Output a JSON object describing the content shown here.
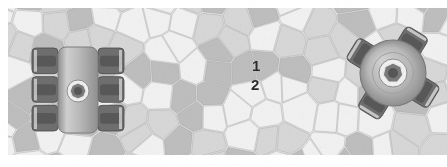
{
  "figure": {
    "kind": "micrograph-schematic",
    "medium": "scanned-grayscale-print",
    "width": 447,
    "height": 167,
    "page_background": "#ffffff",
    "image_bounds": {
      "x": 8,
      "y": 8,
      "width": 439,
      "height": 147
    },
    "description_semantic": "cellular grain / Voronoi microstructure band with two embedded mechanical roller components"
  },
  "palette": {
    "paper": "#ffffff",
    "cell_light": "#f0f0f0",
    "cell_mid": "#d6d6d6",
    "cell_dark": "#bdbdbd",
    "cell_edge": "#9a9a9a",
    "matrix_base": "#e4e4e4",
    "part_body": "#b8b8b8",
    "part_body_light": "#cfcfcf",
    "part_body_dark": "#8f8f8f",
    "roller_dark": "#6e6e6e",
    "roller_darker": "#585858",
    "roller_highlight": "#dcdcdc",
    "hub_ring": "#d8d8d8",
    "hub_socket": "#7a7a7a",
    "hub_core": "#565656",
    "label_text": "#2b2b2b"
  },
  "annotations": {
    "callouts": [
      {
        "id": "callout-1",
        "text": "1",
        "x": 252,
        "y": 58,
        "font_size": 15,
        "bold": true,
        "points_to": "upper-mid-grey-cell"
      },
      {
        "id": "callout-2",
        "text": "2",
        "x": 251,
        "y": 77,
        "font_size": 15,
        "bold": true,
        "points_to": "lower-light-cell"
      }
    ]
  },
  "components": {
    "left_part": {
      "name": "roller-assembly-rectangular",
      "center": {
        "x": 78,
        "y": 90
      },
      "body": {
        "x": 58,
        "y": 47,
        "width": 40,
        "height": 86,
        "radius": 8
      },
      "roller_rows": 3,
      "socket": {
        "cx": 78,
        "cy": 91,
        "r_outer": 11,
        "r_ring": 8,
        "r_core": 4,
        "sides": 8
      }
    },
    "right_part": {
      "name": "hub-rotor-circular",
      "center": {
        "x": 393,
        "y": 73
      },
      "body_radius": 33,
      "lug_count": 4,
      "socket": {
        "cx": 393,
        "cy": 73,
        "r_outer": 14,
        "r_ring": 10,
        "r_core": 5,
        "sides": 7
      }
    }
  },
  "chart_data": {
    "type": "heatmap",
    "title": "",
    "xlabel": "",
    "ylabel": "",
    "note": "Voronoi cell tessellation; each cell carries one of three grey tones",
    "tone_levels": [
      0.94,
      0.84,
      0.74
    ],
    "cell_count_estimate": 96,
    "seed": 20240517
  }
}
